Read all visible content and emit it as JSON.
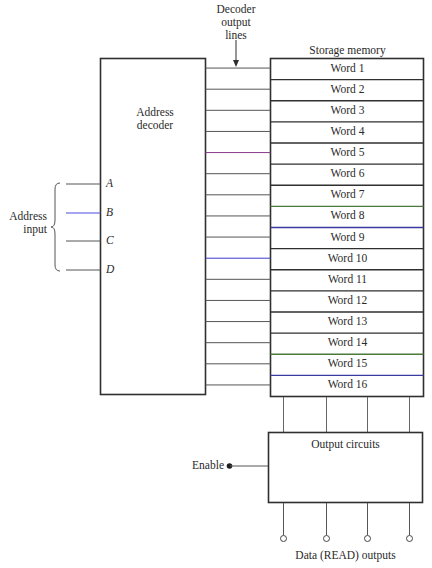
{
  "decoder_output_label": [
    "Decoder",
    "output",
    "lines"
  ],
  "storage_memory": {
    "title": "Storage memory",
    "words": [
      "Word 1",
      "Word 2",
      "Word 3",
      "Word 4",
      "Word 5",
      "Word 6",
      "Word 7",
      "Word 8",
      "Word 9",
      "Word 10",
      "Word 11",
      "Word 12",
      "Word 13",
      "Word 14",
      "Word 15",
      "Word 16"
    ]
  },
  "address_decoder": {
    "label_line1": "Address",
    "label_line2": "decoder"
  },
  "address_input": {
    "label_line1": "Address",
    "label_line2": "input",
    "lines": [
      "A",
      "B",
      "C",
      "D"
    ]
  },
  "output_circuits": {
    "label": "Output circuits"
  },
  "enable": {
    "label": "Enable"
  },
  "data_outputs": {
    "label": "Data (READ) outputs",
    "count": 4
  },
  "colors": {
    "line": "#3a3a3a",
    "thin_line": "#555555",
    "decoder_line_5": "#8a3a8a",
    "decoder_line_10": "#3a3ad0",
    "address_line_b": "#4a4ae0",
    "separator_green": "#4a7a3a",
    "separator_blue": "#3a3aa0"
  }
}
